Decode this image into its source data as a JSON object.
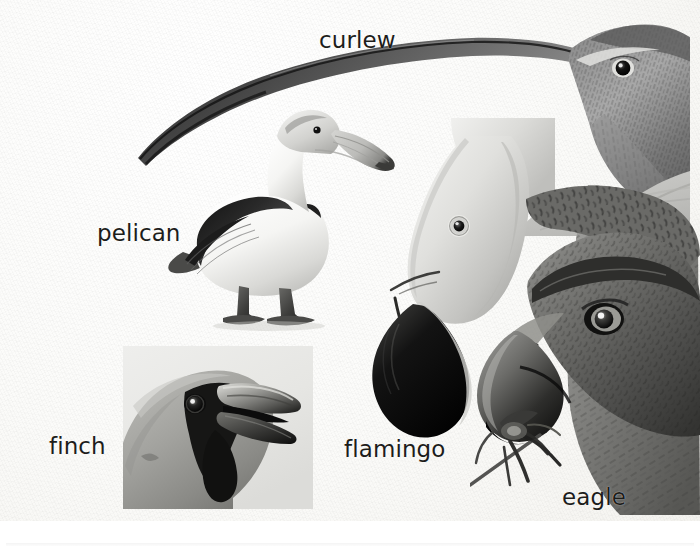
{
  "plate": {
    "title": "Bird beak shapes illustration plate",
    "medium": "grayscale pencil illustration on textured paper",
    "width": 700,
    "height": 557,
    "background_color": "#f7f6f3",
    "ink_color": "#1d1d1b"
  },
  "labels": {
    "curlew": "curlew",
    "pelican": "pelican",
    "finch": "finch",
    "flamingo": "flamingo",
    "eagle": "eagle"
  },
  "figures": [
    {
      "id": "curlew",
      "label": "curlew",
      "description": "curlew head with very long downcurved bill sweeping to the left",
      "label_position": {
        "x": 319,
        "y": 29
      }
    },
    {
      "id": "pelican",
      "label": "pelican",
      "description": "full body pelican standing, long straight pouched bill",
      "label_position": {
        "x": 97,
        "y": 222
      }
    },
    {
      "id": "finch",
      "label": "finch",
      "description": "hawfinch head close-up with thick conical seed-cracking beak",
      "label_position": {
        "x": 49,
        "y": 435
      }
    },
    {
      "id": "flamingo",
      "label": "flamingo",
      "description": "flamingo head inverted with sharply down-bent black-tipped bill",
      "label_position": {
        "x": 344,
        "y": 438
      }
    },
    {
      "id": "eagle",
      "label": "eagle",
      "description": "eagle head with hooked raptor beak gripping prey",
      "label_position": {
        "x": 562,
        "y": 486
      }
    }
  ]
}
